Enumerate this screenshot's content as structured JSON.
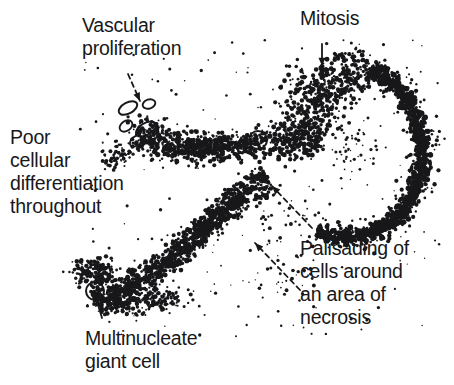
{
  "figure": {
    "background_color": "#ffffff",
    "ink_color": "#18181a",
    "width": 454,
    "height": 385
  },
  "labels": {
    "vascular": "Vascular\nproliferation",
    "mitosis": "Mitosis",
    "poor_differentiation": "Poor\ncellular\ndifferentiation\nthroughout",
    "palisading": "Palisading of\ncells around\nan area of\nnecrosis",
    "multinucleate": "Multinucleate\ngiant cell"
  },
  "annotations": [
    {
      "name": "vascular-proliferation",
      "label": "Vascular proliferation",
      "arrow": {
        "from": [
          128,
          74
        ],
        "to": [
          140,
          101
        ],
        "style": "dashed",
        "head": "down-right"
      },
      "target": "capillary loop cluster"
    },
    {
      "name": "mitosis",
      "label": "Mitosis",
      "arrow": {
        "from": [
          322,
          44
        ],
        "to": [
          322,
          66
        ],
        "style": "solid",
        "head": "down"
      },
      "target": "mitotic figure"
    },
    {
      "name": "poor-differentiation",
      "label": "Poor cellular differentiation throughout",
      "arrow": null,
      "target": "whole tumour field"
    },
    {
      "name": "palisading-upper",
      "label": "Palisading of cells around an area of necrosis",
      "arrow": {
        "from": [
          312,
          228
        ],
        "to": [
          272,
          186
        ],
        "style": "dashed",
        "head": "up-left"
      },
      "target": "upper palisading band"
    },
    {
      "name": "palisading-lower",
      "label": "Palisading of cells around an area of necrosis",
      "arrow": {
        "from": [
          300,
          290
        ],
        "to": [
          255,
          243
        ],
        "style": "dashed",
        "head": "up-left"
      },
      "target": "lower palisading band"
    },
    {
      "name": "multinucleate-giant-cell",
      "label": "Multinucleate giant cell",
      "arrow": {
        "from": [
          102,
          318
        ],
        "to": [
          96,
          298
        ],
        "style": "solid",
        "head": "up"
      },
      "target": "multinucleate giant cell"
    }
  ],
  "features": {
    "giant_cells": [
      {
        "cx": 95,
        "cy": 291,
        "r": 9
      },
      {
        "cx": 258,
        "cy": 140,
        "r": 9
      }
    ],
    "vascular_loops": [
      {
        "cx": 128,
        "cy": 108,
        "rx": 10,
        "ry": 5.5,
        "rot": -28
      },
      {
        "cx": 149,
        "cy": 104,
        "rx": 6.5,
        "ry": 4.5,
        "rot": -18
      },
      {
        "cx": 126,
        "cy": 126,
        "rx": 7,
        "ry": 5,
        "rot": -35
      },
      {
        "cx": 146,
        "cy": 129,
        "rx": 11,
        "ry": 6,
        "rot": -30
      },
      {
        "cx": 136,
        "cy": 141,
        "rx": 7,
        "ry": 4.5,
        "rot": -40
      }
    ],
    "mitotic_figure": {
      "cx": 322,
      "cy": 72,
      "w": 5,
      "h": 11
    },
    "tumour_band_description": "S-shaped stippled band of tumour cells running from lower-left to upper-right, with a dense C-shaped palisading arc on the right enclosing a pale necrotic centre"
  }
}
